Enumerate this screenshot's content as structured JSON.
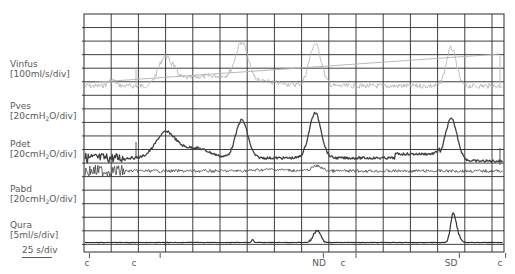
{
  "chart_data": {
    "type": "line",
    "title": "",
    "xlabel": "",
    "time_scale": "25 s/div",
    "grid": true,
    "channels": [
      {
        "name": "Vinfus",
        "unit": "[100ml/s/div]",
        "color": "#b0b0b0"
      },
      {
        "name": "Pves",
        "unit_prefix": "[20cmH",
        "unit_sub": "2",
        "unit_suffix": "O/div]",
        "color": "#404040"
      },
      {
        "name": "Pdet",
        "unit_prefix": "[20cmH",
        "unit_sub": "2",
        "unit_suffix": "O/div]",
        "color": "#404040"
      },
      {
        "name": "Pabd",
        "unit_prefix": "[20cmH",
        "unit_sub": "2",
        "unit_suffix": "O/div]",
        "color": "#404040"
      },
      {
        "name": "Qura",
        "unit": "[5ml/s/div]",
        "color": "#303030"
      }
    ],
    "event_markers": [
      {
        "label": "c",
        "x_div": 0.2
      },
      {
        "label": "c",
        "x_div": 2.8
      },
      {
        "label": "ND",
        "x_div": 8.8
      },
      {
        "label": "c",
        "x_div": 10.0
      },
      {
        "label": "SD",
        "x_div": 13.8
      },
      {
        "label": "c",
        "x_div": 15.5
      }
    ],
    "vinfus_peaks_x_div": [
      3.0,
      5.8,
      8.5,
      13.5
    ],
    "pdet_peaks_x_div": [
      3.0,
      5.8,
      8.5,
      13.5
    ],
    "qura_peaks": [
      {
        "x_div": 6.2,
        "height_div": 0.2
      },
      {
        "x_div": 8.7,
        "height_div": 1.0
      },
      {
        "x_div": 13.7,
        "height_div": 2.0
      }
    ]
  },
  "labels": {
    "vinfus": "Vinfus",
    "vinfus_unit": "[100ml/s/div]",
    "pves": "Pves",
    "pdet": "Pdet",
    "pabd": "Pabd",
    "qura": "Qura",
    "qura_unit": "[5ml/s/div]",
    "p_unit_prefix": "[20cmH",
    "p_unit_sub": "2",
    "p_unit_suffix": "O/div]",
    "scale": "25 s/div"
  },
  "markers": {
    "m0": "c",
    "m1": "c",
    "m2": "ND",
    "m3": "c",
    "m4": "SD",
    "m5": "c"
  }
}
